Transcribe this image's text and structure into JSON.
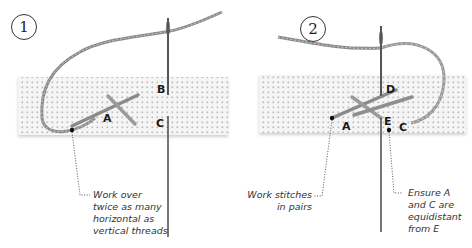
{
  "panels": [
    {
      "step": "1",
      "labels": {
        "A": "A",
        "B": "B",
        "C": "C"
      },
      "caption": {
        "lines": [
          "Work over",
          "twice as many",
          "horizontal as",
          "vertical threads"
        ]
      }
    },
    {
      "step": "2",
      "labels": {
        "A": "A",
        "C": "C",
        "D": "D",
        "E": "E"
      },
      "caption_left": {
        "lines": [
          "Work stitches",
          "in pairs"
        ]
      },
      "caption_right": {
        "lines": [
          "Ensure A",
          "and C are",
          "equidistant",
          "from E"
        ]
      }
    }
  ],
  "colors": {
    "fabric": "#f4f4f4",
    "fabric_dot": "#b8b8b8",
    "thread": "#8a8a8a",
    "thread_highlight": "#c4c4c4",
    "needle": "#555555",
    "leader": "#444444",
    "text": "#333333"
  },
  "icons": {
    "needle": "needle-icon",
    "thread": "thread-icon",
    "fabric": "evenweave-fabric"
  }
}
